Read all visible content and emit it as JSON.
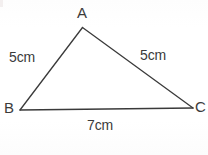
{
  "figure": {
    "kind": "triangle-diagram",
    "background_color": "#fefefe",
    "stroke_color": "#3a3a3a",
    "text_color": "#3b3b3b",
    "vertices": [
      {
        "id": "A",
        "label": "A",
        "x": 82.5,
        "y": 27.5
      },
      {
        "id": "B",
        "label": "B",
        "x": 20.0,
        "y": 110.0
      },
      {
        "id": "C",
        "label": "C",
        "x": 193.0,
        "y": 108.0
      }
    ],
    "sides": [
      {
        "id": "AB",
        "label": "5cm",
        "from": "A",
        "to": "B",
        "length": 5,
        "unit": "cm"
      },
      {
        "id": "AC",
        "label": "5cm",
        "from": "A",
        "to": "C",
        "length": 5,
        "unit": "cm"
      },
      {
        "id": "BC",
        "label": "7cm",
        "from": "B",
        "to": "C",
        "length": 7,
        "unit": "cm"
      }
    ]
  },
  "labels": {
    "vertex_a": "A",
    "vertex_b": "B",
    "vertex_c": "C",
    "side_ab": "5cm",
    "side_ac": "5cm",
    "side_bc": "7cm"
  }
}
